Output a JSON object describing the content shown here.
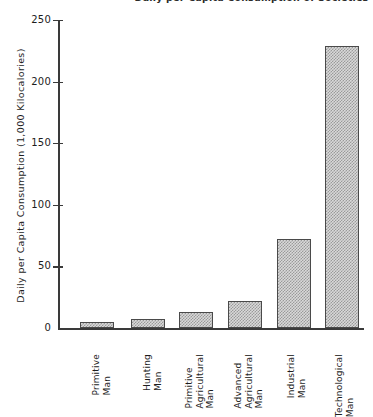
{
  "chart_data": {
    "type": "bar",
    "title": "Daily per Capita Consumption of Societies",
    "xlabel": "",
    "ylabel": "Daily per Capita Consumption (1,000 Kilocalories)",
    "ylim": [
      0,
      250
    ],
    "yticks": [
      0,
      50,
      100,
      150,
      200,
      250
    ],
    "grid": false,
    "legend": null,
    "categories": [
      "Primitive Man",
      "Hunting Man",
      "Primitive\nAgricultural\nMan",
      "Advanced\nAgricultural\nMan",
      "Industrial\nMan",
      "Technological\nMan"
    ],
    "values": [
      5,
      7,
      13,
      22,
      72,
      229
    ],
    "bar_fill": "#d9d9d9",
    "bar_pattern": "stipple-checker",
    "bar_edge_color": "#4a4a4a",
    "axis_color": "#3a3a3a",
    "background": "#ffffff"
  },
  "axis": {
    "tick_labels": [
      "250",
      "200",
      "150",
      "100",
      "50",
      "0"
    ]
  }
}
